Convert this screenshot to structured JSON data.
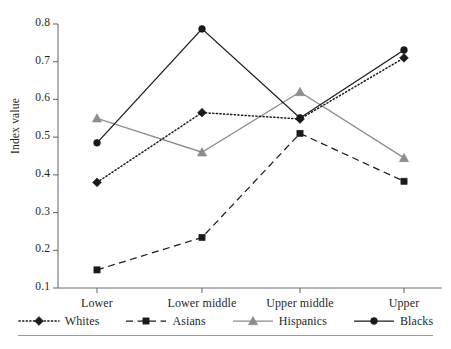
{
  "chart_data": {
    "type": "line",
    "title": "",
    "xlabel": "",
    "ylabel": "Index value",
    "categories": [
      "Lower",
      "Lower middle",
      "Upper middle",
      "Upper"
    ],
    "ylim": [
      0.1,
      0.8
    ],
    "ytick_labels": [
      "0.1",
      "0.2",
      "0.3",
      "0.4",
      "0.5",
      "0.6",
      "0.7",
      "0.8"
    ],
    "ytick_values": [
      0.1,
      0.2,
      0.3,
      0.4,
      0.5,
      0.6,
      0.7,
      0.8
    ],
    "grid": false,
    "legend_position": "bottom",
    "series": [
      {
        "name": "Whites",
        "values": [
          0.38,
          0.565,
          0.548,
          0.71
        ],
        "color": "#1a1a1a",
        "line_style": "dotted",
        "marker": "diamond"
      },
      {
        "name": "Asians",
        "values": [
          0.148,
          0.234,
          0.51,
          0.383
        ],
        "color": "#1a1a1a",
        "line_style": "dashed",
        "marker": "square"
      },
      {
        "name": "Hispanics",
        "values": [
          0.55,
          0.46,
          0.62,
          0.445
        ],
        "color": "#8c8c8c",
        "line_style": "solid",
        "marker": "triangle"
      },
      {
        "name": "Blacks",
        "values": [
          0.485,
          0.787,
          0.551,
          0.731
        ],
        "color": "#1a1a1a",
        "line_style": "solid",
        "marker": "circle"
      }
    ]
  }
}
